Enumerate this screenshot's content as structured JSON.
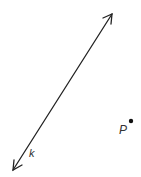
{
  "figure": {
    "line": {
      "label": "k",
      "start": [
        13,
        170
      ],
      "end": [
        112,
        14
      ],
      "color": "#222222",
      "arrows": "both"
    },
    "point": {
      "label": "P",
      "position": [
        131,
        121
      ],
      "color": "#111111"
    }
  }
}
